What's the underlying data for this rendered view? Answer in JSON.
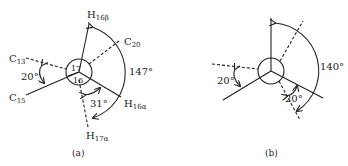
{
  "figure": {
    "panel_a": {
      "caption": "(a)",
      "center_labels": {
        "front": "17",
        "back": "16"
      },
      "substituents": [
        {
          "name": "H16β",
          "base": "H",
          "sub": "16β",
          "bond": "solid"
        },
        {
          "name": "C20",
          "base": "C",
          "sub": "20",
          "bond": "dashed"
        },
        {
          "name": "C13",
          "base": "C",
          "sub": "13",
          "bond": "dashed"
        },
        {
          "name": "C15",
          "base": "C",
          "sub": "15",
          "bond": "solid"
        },
        {
          "name": "H16α",
          "base": "H",
          "sub": "16α",
          "bond": "solid"
        },
        {
          "name": "H17α",
          "base": "H",
          "sub": "17α",
          "bond": "dashed"
        }
      ],
      "angles": {
        "left": "20°",
        "bottom": "31°",
        "right": "147°"
      }
    },
    "panel_b": {
      "caption": "(b)",
      "angles": {
        "left": "20°",
        "bottom": "20°",
        "right": "140°"
      }
    }
  }
}
